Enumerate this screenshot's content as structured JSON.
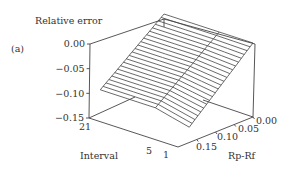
{
  "chart_data": {
    "type": "surface3d",
    "panel_label": "(a)",
    "zlabel": "Relative error",
    "xlabel": "Interval",
    "ylabel": "Rp-Rf",
    "z_ticks": [
      "0.00",
      "-0.05",
      "-0.10",
      "-0.15"
    ],
    "z_tick_values": [
      0.0,
      -0.05,
      -0.1,
      -0.15
    ],
    "x_ticks": [
      "21",
      "5",
      "1"
    ],
    "x_tick_values": [
      21,
      5,
      1
    ],
    "y_ticks": [
      "0.00",
      "0.05",
      "0.10",
      "0.15"
    ],
    "y_tick_values": [
      0.0,
      0.05,
      0.1,
      0.15
    ],
    "zlim": [
      -0.15,
      0.0
    ],
    "xlim": [
      1,
      21
    ],
    "ylim": [
      0.0,
      0.2
    ],
    "grid": false,
    "surface": {
      "description": "Relative error is ~0 at Rp-Rf = 0 and decreases roughly linearly with Rp-Rf, nearly constant across Interval",
      "interval": [
        1,
        5,
        21
      ],
      "rp_rf": [
        0.0,
        0.05,
        0.1,
        0.15,
        0.2
      ],
      "z": [
        [
          0.0,
          -0.035,
          -0.07,
          -0.105,
          -0.14
        ],
        [
          0.0,
          -0.03,
          -0.06,
          -0.09,
          -0.12
        ],
        [
          0.0,
          -0.03,
          -0.06,
          -0.09,
          -0.12
        ]
      ]
    }
  }
}
